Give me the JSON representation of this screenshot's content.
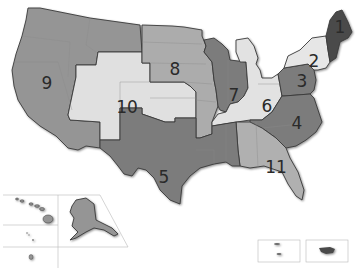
{
  "map": {
    "title": "United States circuit regions",
    "colors": {
      "dark": "#4a4a4a",
      "medium_dark": "#7c7c7c",
      "medium": "#959595",
      "medium_light": "#acacac",
      "light": "#d6d6d6",
      "very_light": "#e6e6e6",
      "background": "#ffffff"
    },
    "regions": [
      {
        "id": "1",
        "label": "1",
        "states": [
          "ME",
          "NH",
          "MA",
          "RI"
        ],
        "shade": "dark"
      },
      {
        "id": "2",
        "label": "2",
        "states": [
          "NY",
          "VT",
          "CT"
        ],
        "shade": "very_light"
      },
      {
        "id": "3",
        "label": "3",
        "states": [
          "PA",
          "NJ",
          "DE"
        ],
        "shade": "medium_dark"
      },
      {
        "id": "4",
        "label": "4",
        "states": [
          "MD",
          "VA",
          "WV",
          "NC",
          "SC"
        ],
        "shade": "medium_dark"
      },
      {
        "id": "5",
        "label": "5",
        "states": [
          "TX",
          "LA",
          "MS"
        ],
        "shade": "medium_dark"
      },
      {
        "id": "6",
        "label": "6",
        "states": [
          "MI",
          "OH",
          "KY",
          "TN"
        ],
        "shade": "very_light"
      },
      {
        "id": "7",
        "label": "7",
        "states": [
          "WI",
          "IL",
          "IN"
        ],
        "shade": "medium_dark"
      },
      {
        "id": "8",
        "label": "8",
        "states": [
          "ND",
          "SD",
          "NE",
          "MN",
          "IA",
          "MO",
          "AR"
        ],
        "shade": "medium_light"
      },
      {
        "id": "9",
        "label": "9",
        "states": [
          "WA",
          "OR",
          "CA",
          "NV",
          "ID",
          "MT",
          "AZ",
          "AK",
          "HI"
        ],
        "shade": "medium"
      },
      {
        "id": "10",
        "label": "10",
        "states": [
          "WY",
          "UT",
          "CO",
          "KS",
          "OK",
          "NM"
        ],
        "shade": "very_light"
      },
      {
        "id": "11",
        "label": "11",
        "states": [
          "AL",
          "GA",
          "FL"
        ],
        "shade": "medium_light"
      }
    ],
    "insets": [
      "alaska",
      "hawaii",
      "pacific-islands",
      "guam",
      "virgin-islands",
      "puerto-rico"
    ]
  }
}
